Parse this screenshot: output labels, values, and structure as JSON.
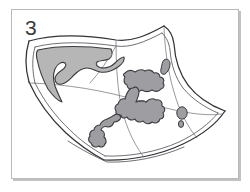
{
  "figure": {
    "number_label": "3",
    "caption": ""
  },
  "panel": {
    "border_color": "#b9b9bb",
    "background_color": "#ffffff",
    "shadow_color": "#78787c"
  },
  "illustration": {
    "name": "folded-map-drawing",
    "ink_color": "#333338",
    "fold_line_color": "#56565c",
    "paper_fill": "#ffffff",
    "landmass_fill_light": "#b5b5b5",
    "landmass_fill_dark": "#9d9da1",
    "elements": [
      {
        "name": "map-sheet-outline",
        "kind": "outline"
      },
      {
        "name": "map-sheet-inner-edge",
        "kind": "outline"
      },
      {
        "name": "vertical-fold-crease",
        "kind": "fold"
      },
      {
        "name": "horizontal-fold-crease",
        "kind": "fold"
      },
      {
        "name": "landmass-left-shaded",
        "kind": "region",
        "tone": "light"
      },
      {
        "name": "landmass-upper-centre",
        "kind": "region",
        "tone": "dark"
      },
      {
        "name": "landmass-centre-peninsula",
        "kind": "region",
        "tone": "dark"
      },
      {
        "name": "landmass-lower-left-strip",
        "kind": "region",
        "tone": "dark"
      },
      {
        "name": "island-small-upper",
        "kind": "region",
        "tone": "dark"
      },
      {
        "name": "island-small-lower",
        "kind": "region",
        "tone": "dark"
      },
      {
        "name": "islet-top-right",
        "kind": "region",
        "tone": "dark"
      }
    ]
  }
}
